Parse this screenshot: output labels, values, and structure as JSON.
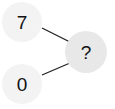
{
  "diagram": {
    "nodes": [
      {
        "id": "top",
        "label": "7",
        "role": "input"
      },
      {
        "id": "bottom",
        "label": "0",
        "role": "input"
      },
      {
        "id": "result",
        "label": "?",
        "role": "output"
      }
    ],
    "edges": [
      {
        "from": "top",
        "to": "result"
      },
      {
        "from": "bottom",
        "to": "result"
      }
    ],
    "colors": {
      "input_fill": "#f3f3f3",
      "output_fill": "#e8e8e8",
      "edge": "#222222",
      "text": "#111111"
    }
  }
}
